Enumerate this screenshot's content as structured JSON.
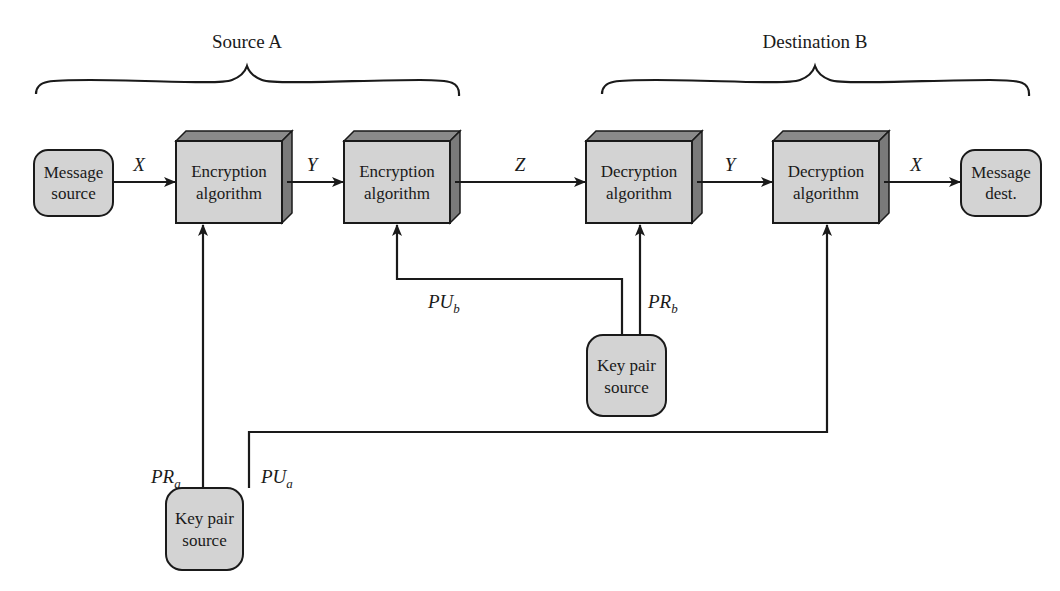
{
  "headers": {
    "source": "Source A",
    "destination": "Destination B"
  },
  "nodes": {
    "message_source": [
      "Message",
      "source"
    ],
    "enc1": [
      "Encryption",
      "algorithm"
    ],
    "enc2": [
      "Encryption",
      "algorithm"
    ],
    "dec1": [
      "Decryption",
      "algorithm"
    ],
    "dec2": [
      "Decryption",
      "algorithm"
    ],
    "message_dest": [
      "Message",
      "dest."
    ],
    "keypair_b": [
      "Key pair",
      "source"
    ],
    "keypair_a": [
      "Key pair",
      "source"
    ]
  },
  "edges": {
    "x1": "X",
    "y1": "Y",
    "z": "Z",
    "y2": "Y",
    "x2": "X"
  },
  "keys": {
    "pu_b": {
      "main": "PU",
      "sub": "b"
    },
    "pr_b": {
      "main": "PR",
      "sub": "b"
    },
    "pr_a": {
      "main": "PR",
      "sub": "a"
    },
    "pu_a": {
      "main": "PU",
      "sub": "a"
    }
  },
  "colors": {
    "box_fill": "#d3d3d3",
    "box_top": "#8a8a8a",
    "box_side": "#7a7a7a",
    "stroke": "#1a1a1a"
  }
}
